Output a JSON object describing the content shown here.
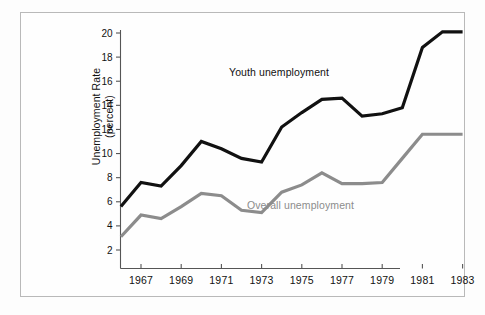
{
  "figure": {
    "background_color": "#fdfdfd",
    "frame_color": "#b9b9b9"
  },
  "axes": {
    "y_axis_title_line1": "Unemployment Rate",
    "y_axis_title_line2": "(percent)",
    "x_axis_title": "",
    "y_ticks": [
      "2",
      "4",
      "6",
      "8",
      "10",
      "12",
      "14",
      "16",
      "18",
      "20"
    ],
    "x_ticks": [
      "1967",
      "1969",
      "1971",
      "1973",
      "1975",
      "1977",
      "1979",
      "1981",
      "1983"
    ]
  },
  "annotations": {
    "youth_label": "Youth unemployment",
    "overall_label": "Overall unemployment"
  },
  "colors": {
    "youth_line": "#111111",
    "overall_line": "#8c8c8c",
    "axis": "#555555"
  },
  "chart_data": {
    "type": "line",
    "title": "",
    "xlabel": "",
    "ylabel": "Unemployment Rate (percent)",
    "xlim": [
      1966,
      1983
    ],
    "ylim": [
      0.6,
      21.2
    ],
    "yticks": [
      2,
      4,
      6,
      8,
      10,
      12,
      14,
      16,
      18,
      20
    ],
    "xticks": [
      1967,
      1969,
      1971,
      1973,
      1975,
      1977,
      1979,
      1981,
      1983
    ],
    "grid": false,
    "legend": "inline-annotations",
    "x": [
      1966,
      1967,
      1968,
      1969,
      1970,
      1971,
      1972,
      1973,
      1974,
      1975,
      1976,
      1977,
      1978,
      1979,
      1980,
      1981,
      1982,
      1983
    ],
    "series": [
      {
        "name": "Youth unemployment",
        "color": "#111111",
        "linewidth": 3.2,
        "values": [
          5.6,
          7.6,
          7.3,
          9.0,
          11.0,
          10.4,
          9.6,
          9.3,
          12.2,
          13.4,
          14.5,
          14.6,
          13.1,
          13.3,
          13.8,
          18.8,
          20.1,
          20.1
        ]
      },
      {
        "name": "Overall unemployment",
        "color": "#8c8c8c",
        "linewidth": 3.2,
        "values": [
          3.1,
          4.9,
          4.6,
          5.6,
          6.7,
          6.5,
          5.3,
          5.1,
          6.8,
          7.4,
          8.4,
          7.5,
          7.5,
          7.6,
          9.6,
          11.6,
          11.6,
          11.6
        ]
      }
    ]
  }
}
